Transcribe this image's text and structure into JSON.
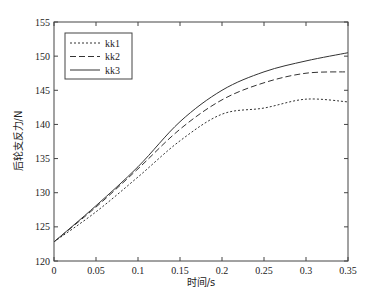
{
  "chart_data": {
    "type": "line",
    "title": "",
    "xlabel": "时间/s",
    "ylabel": "后轮支反力/N",
    "xlim": [
      0,
      0.35
    ],
    "ylim": [
      120,
      155
    ],
    "xticks": [
      0,
      0.05,
      0.1,
      0.15,
      0.2,
      0.25,
      0.3,
      0.35
    ],
    "xtick_labels": [
      "0",
      "0.05",
      "0.1",
      "0.15",
      "0.2",
      "0.25",
      "0.3",
      "0.35"
    ],
    "yticks": [
      120,
      125,
      130,
      135,
      140,
      145,
      150,
      155
    ],
    "ytick_labels": [
      "120",
      "125",
      "130",
      "135",
      "140",
      "145",
      "150",
      "155"
    ],
    "grid": false,
    "legend_position": "upper left",
    "x": [
      0,
      0.05,
      0.1,
      0.15,
      0.2,
      0.25,
      0.3,
      0.35
    ],
    "series": [
      {
        "name": "kk1",
        "style": "dotted",
        "color": "#333333",
        "values": [
          122.8,
          127.2,
          132.3,
          137.6,
          141.5,
          142.4,
          143.7,
          143.3
        ]
      },
      {
        "name": "kk2",
        "style": "dashed",
        "color": "#333333",
        "values": [
          122.8,
          127.9,
          133.5,
          139.3,
          143.6,
          146.1,
          147.5,
          147.7
        ]
      },
      {
        "name": "kk3",
        "style": "solid",
        "color": "#333333",
        "values": [
          122.8,
          128.1,
          133.8,
          140.4,
          145.0,
          147.7,
          149.3,
          150.5
        ]
      }
    ]
  }
}
